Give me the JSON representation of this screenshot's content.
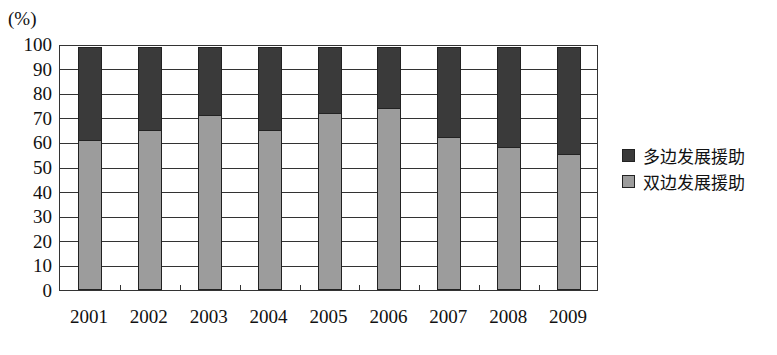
{
  "chart_data": {
    "type": "bar",
    "stacked": true,
    "title": "",
    "ylabel": "(%)",
    "xlabel": "",
    "ylim": [
      0,
      100
    ],
    "yticks": [
      0,
      10,
      20,
      30,
      40,
      50,
      60,
      70,
      80,
      90,
      100
    ],
    "grid": true,
    "legend_position": "right",
    "categories": [
      "2001",
      "2002",
      "2003",
      "2004",
      "2005",
      "2006",
      "2007",
      "2008",
      "2009"
    ],
    "series": [
      {
        "name": "双边发展援助",
        "color": "#9c9c9c",
        "values": [
          62,
          66,
          72,
          66,
          73,
          75,
          63,
          59,
          56
        ]
      },
      {
        "name": "多边发展援助",
        "color": "#3a3a3a",
        "values": [
          38,
          34,
          28,
          34,
          27,
          25,
          37,
          41,
          44
        ]
      }
    ]
  },
  "legend": {
    "items": [
      {
        "label": "多边发展援助",
        "color": "#3a3a3a"
      },
      {
        "label": "双边发展援助",
        "color": "#9c9c9c"
      }
    ]
  }
}
